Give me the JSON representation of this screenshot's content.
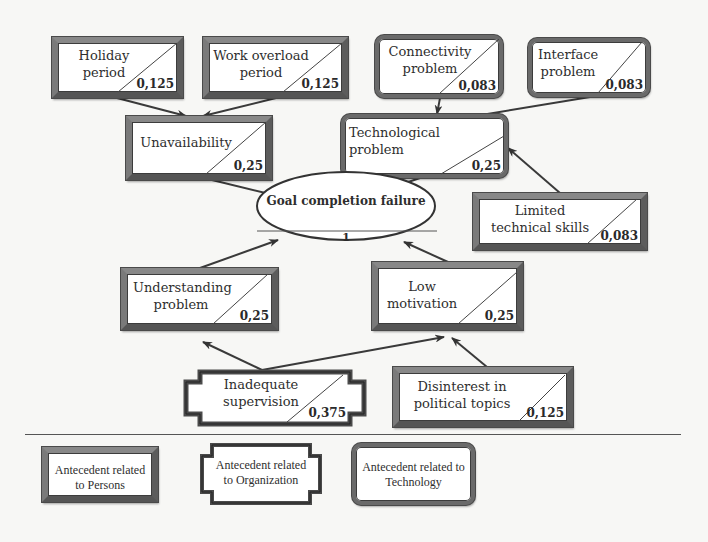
{
  "diagram": {
    "goal": {
      "label": "Goal completion failure",
      "value": "1"
    },
    "nodes": {
      "holiday": {
        "label": "Holiday period",
        "value": "0,125",
        "type": "person"
      },
      "work_overload": {
        "label": "Work overload period",
        "value": "0,125",
        "type": "person"
      },
      "connectivity": {
        "label": "Connectivity problem",
        "value": "0,083",
        "type": "technology"
      },
      "interface": {
        "label": "Interface problem",
        "value": "0,083",
        "type": "technology"
      },
      "unavailability": {
        "label": "Unavailability",
        "value": "0,25",
        "type": "person"
      },
      "technological": {
        "label": "Technological problem",
        "value": "0,25",
        "type": "technology"
      },
      "limited_skills": {
        "label": "Limited technical skills",
        "value": "0,083",
        "type": "person"
      },
      "understanding": {
        "label": "Understanding problem",
        "value": "0,25",
        "type": "person"
      },
      "low_motivation": {
        "label": "Low motivation",
        "value": "0,25",
        "type": "person"
      },
      "inadequate_supervision": {
        "label": "Inadequate supervision",
        "value": "0,375",
        "type": "organization"
      },
      "disinterest": {
        "label": "Disinterest in political topics",
        "value": "0,125",
        "type": "person"
      }
    },
    "edges": [
      [
        "Holiday period",
        "Unavailability"
      ],
      [
        "Work overload period",
        "Unavailability"
      ],
      [
        "Connectivity problem",
        "Technological problem"
      ],
      [
        "Interface problem",
        "Technological problem"
      ],
      [
        "Limited technical skills",
        "Technological problem"
      ],
      [
        "Unavailability",
        "Goal completion failure"
      ],
      [
        "Technological problem",
        "Goal completion failure"
      ],
      [
        "Understanding problem",
        "Goal completion failure"
      ],
      [
        "Low motivation",
        "Goal completion failure"
      ],
      [
        "Inadequate supervision",
        "Understanding problem"
      ],
      [
        "Inadequate supervision",
        "Low motivation"
      ],
      [
        "Disinterest in political topics",
        "Low motivation"
      ]
    ]
  },
  "legend": {
    "persons": "Antecedent related to Persons",
    "organization": "Antecedent related to Organization",
    "technology": "Antecedent related to Technology"
  }
}
